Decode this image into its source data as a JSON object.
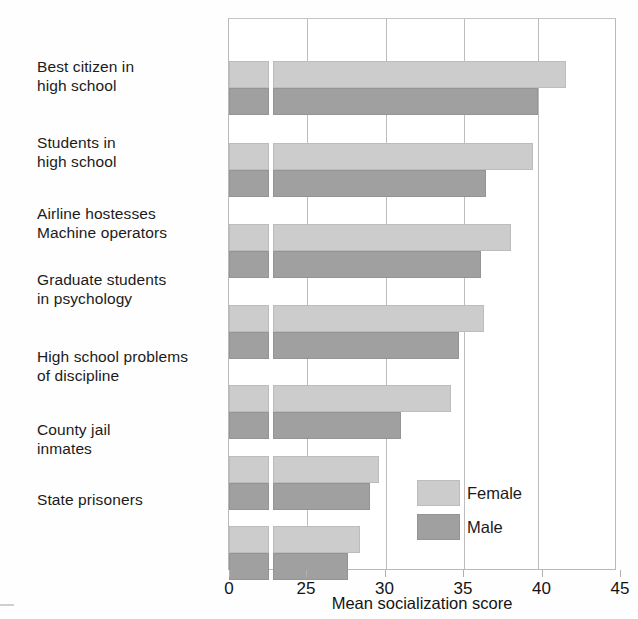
{
  "chart_data": {
    "type": "bar",
    "orientation": "horizontal",
    "title": "",
    "subtitle": "",
    "xlabel": "Mean socialization score",
    "ylabel": "",
    "xlim": [
      0,
      45
    ],
    "axis_break": {
      "present": true,
      "after": 0,
      "before": 25,
      "note": "x-axis is broken between 0 and 25; bars are drawn from 0 with a white gap at the break"
    },
    "xticks": [
      0,
      25,
      30,
      35,
      40,
      45
    ],
    "xticklabels": [
      "0",
      "25",
      "30",
      "35",
      "40",
      "45"
    ],
    "grid": "vertical gridlines at 25, 30, 35, 40",
    "legend": {
      "position": "inside lower right",
      "entries": [
        {
          "name": "Female",
          "color": "#cccccc"
        },
        {
          "name": "Male",
          "color": "#a0a0a0"
        }
      ]
    },
    "categories": [
      "Best citizen in\nhigh school",
      "Students in\nhigh school",
      "Airline hostesses\nMachine operators",
      "Graduate students\nin psychology",
      "High school problems\nof discipline",
      "County jail\ninmates",
      "State prisoners"
    ],
    "series": [
      {
        "name": "Female",
        "color": "#cccccc",
        "values": [
          41.5,
          39.4,
          38.0,
          36.3,
          34.2,
          29.6,
          28.4
        ]
      },
      {
        "name": "Male",
        "color": "#a0a0a0",
        "values": [
          39.7,
          36.4,
          36.1,
          34.7,
          31.0,
          29.0,
          27.6
        ]
      }
    ]
  },
  "axis": {
    "x_title": "Mean socialization score",
    "ticks": [
      {
        "label": "0",
        "value": 0
      },
      {
        "label": "25",
        "value": 25
      },
      {
        "label": "30",
        "value": 30
      },
      {
        "label": "35",
        "value": 35
      },
      {
        "label": "40",
        "value": 40
      },
      {
        "label": "45",
        "value": 45
      }
    ]
  },
  "categories": [
    {
      "label": "Best citizen in\nhigh school"
    },
    {
      "label": "Students in\nhigh school"
    },
    {
      "label": "Airline hostesses\nMachine operators"
    },
    {
      "label": "Graduate students\nin psychology"
    },
    {
      "label": "High school problems\nof discipline"
    },
    {
      "label": "County jail\ninmates"
    },
    {
      "label": "State prisoners"
    }
  ],
  "legend": {
    "female_label": "Female",
    "male_label": "Male",
    "female_color": "#cccccc",
    "male_color": "#a0a0a0"
  },
  "colors": {
    "female": "#cccccc",
    "male": "#a0a0a0",
    "frame": "#b9b9b9",
    "gridline": "#bdbdbd",
    "text": "#1b1b1b",
    "background": "#ffffff"
  }
}
